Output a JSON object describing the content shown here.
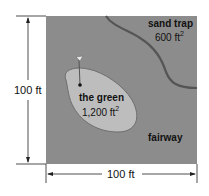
{
  "figure": {
    "type": "area diagram of golf hole",
    "colors": {
      "fairway": "#8c8c8c",
      "green": "#bdbdbd",
      "green_outline": "#6e6e6e",
      "sand_trap_boundary": "#555555",
      "dimension_lines": "#222222"
    },
    "height_label": "100 ft",
    "width_label": "100 ft",
    "sand_trap": {
      "name": "sand trap",
      "area_value": "600 ft",
      "area_exp": "2"
    },
    "green": {
      "name": "the green",
      "area_value": "1,200 ft",
      "area_exp": "2"
    },
    "fairway": {
      "name": "fairway"
    },
    "flag": {
      "icon": "flag-icon"
    }
  }
}
